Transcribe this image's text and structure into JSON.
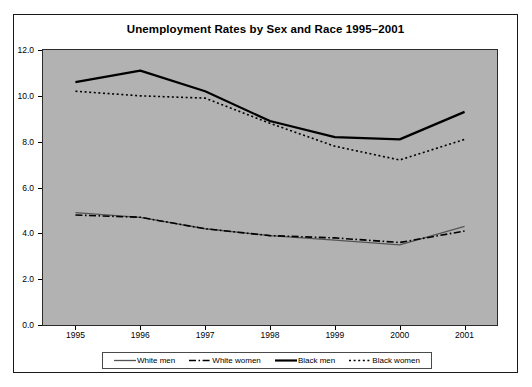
{
  "chart": {
    "title": "Unemployment Rates by Sex and Race 1995–2001"
  },
  "legend": {
    "items": [
      {
        "label": "White men",
        "style": "solid-thin",
        "color": "#555555",
        "icon": "line-solid-icon"
      },
      {
        "label": "White women",
        "style": "dash-dot",
        "color": "#000000",
        "icon": "line-dashdot-icon"
      },
      {
        "label": "Black men",
        "style": "solid-thick",
        "color": "#000000",
        "icon": "line-solid-thick-icon"
      },
      {
        "label": "Black women",
        "style": "dotted",
        "color": "#000000",
        "icon": "line-dotted-icon"
      }
    ]
  },
  "axes": {
    "y_ticks": [
      "0.0",
      "2.0",
      "4.0",
      "6.0",
      "8.0",
      "10.0",
      "12.0"
    ],
    "x_ticks": [
      "1995",
      "1996",
      "1997",
      "1998",
      "1999",
      "2000",
      "2001"
    ]
  },
  "chart_data": {
    "type": "line",
    "title": "Unemployment Rates by Sex and Race 1995–2001",
    "xlabel": "",
    "ylabel": "",
    "x": [
      1995,
      1996,
      1997,
      1998,
      1999,
      2000,
      2001
    ],
    "categories": [
      "1995",
      "1996",
      "1997",
      "1998",
      "1999",
      "2000",
      "2001"
    ],
    "ylim": [
      0.0,
      12.0
    ],
    "ytick_step": 2.0,
    "grid": false,
    "legend_position": "bottom",
    "plot_background": "#b2b2b2",
    "series": [
      {
        "name": "White men",
        "values": [
          4.9,
          4.7,
          4.2,
          3.9,
          3.7,
          3.5,
          4.3
        ],
        "style": "solid-thin",
        "color": "#555555"
      },
      {
        "name": "White women",
        "values": [
          4.8,
          4.7,
          4.2,
          3.9,
          3.8,
          3.6,
          4.1
        ],
        "style": "dash-dot",
        "color": "#000000"
      },
      {
        "name": "Black men",
        "values": [
          10.6,
          11.1,
          10.2,
          8.9,
          8.2,
          8.1,
          9.3
        ],
        "style": "solid-thick",
        "color": "#000000"
      },
      {
        "name": "Black women",
        "values": [
          10.2,
          10.0,
          9.9,
          8.8,
          7.8,
          7.2,
          8.1
        ],
        "style": "dotted",
        "color": "#000000"
      }
    ]
  }
}
